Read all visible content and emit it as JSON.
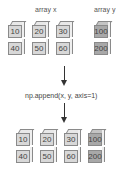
{
  "labels": {
    "array_x": "array x",
    "array_y": "array y",
    "operation": "np.append(x, y, axis=1)"
  },
  "array_x": {
    "rows": [
      [
        "10",
        "20",
        "30"
      ],
      [
        "40",
        "50",
        "60"
      ]
    ]
  },
  "array_y": {
    "rows": [
      [
        "100"
      ],
      [
        "200"
      ]
    ]
  },
  "result": {
    "rows": [
      [
        "10",
        "20",
        "30",
        "100"
      ],
      [
        "40",
        "50",
        "60",
        "200"
      ]
    ]
  },
  "colors": {
    "light_cell": "#d8d8d8",
    "dark_cell": "#a8a8a8",
    "border": "#8a8a8a",
    "arrow": "#333333"
  }
}
